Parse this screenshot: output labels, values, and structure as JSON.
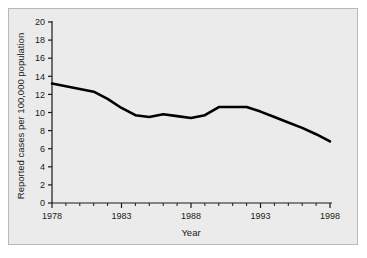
{
  "chart_data": {
    "type": "line",
    "title": "",
    "subtitle": "",
    "xlabel": "Year",
    "ylabel": "Reported cases per 100,000 population",
    "xlim": [
      1978,
      1998
    ],
    "ylim": [
      0,
      20
    ],
    "grid": false,
    "legend": null,
    "annotations": [],
    "x_major_ticks": [
      1978,
      1983,
      1988,
      1993,
      1998
    ],
    "x_major_tick_labels": [
      "1978",
      "1983",
      "1988",
      "1993",
      "1998"
    ],
    "x_minor_ticks": [
      1979,
      1980,
      1981,
      1982,
      1984,
      1985,
      1986,
      1987,
      1989,
      1990,
      1991,
      1992,
      1994,
      1995,
      1996,
      1997
    ],
    "y_ticks": [
      0,
      2,
      4,
      6,
      8,
      10,
      12,
      14,
      16,
      18,
      20
    ],
    "y_tick_labels": [
      "0",
      "2",
      "4",
      "6",
      "8",
      "10",
      "12",
      "14",
      "16",
      "18",
      "20"
    ],
    "x": [
      1978,
      1979,
      1980,
      1981,
      1982,
      1983,
      1984,
      1985,
      1986,
      1987,
      1988,
      1989,
      1990,
      1991,
      1992,
      1993,
      1994,
      1995,
      1996,
      1997,
      1998
    ],
    "values": [
      13.2,
      12.9,
      12.6,
      12.3,
      11.5,
      10.5,
      9.7,
      9.5,
      9.8,
      9.6,
      9.4,
      9.7,
      10.6,
      10.6,
      10.6,
      10.1,
      9.5,
      8.9,
      8.3,
      7.6,
      6.8
    ],
    "series": [
      {
        "name": "Reported cases",
        "color": "#000000",
        "line_width": 2.6,
        "values": [
          13.2,
          12.9,
          12.6,
          12.3,
          11.5,
          10.5,
          9.7,
          9.5,
          9.8,
          9.6,
          9.4,
          9.7,
          10.6,
          10.6,
          10.6,
          10.1,
          9.5,
          8.9,
          8.3,
          7.6,
          6.8
        ]
      }
    ],
    "colors": {
      "line": "#000000",
      "plot_background": "#ebebeb",
      "figure_background": "#ffffff",
      "axis": "#1a1a1a",
      "frame_border": "#b9b9b9"
    }
  }
}
